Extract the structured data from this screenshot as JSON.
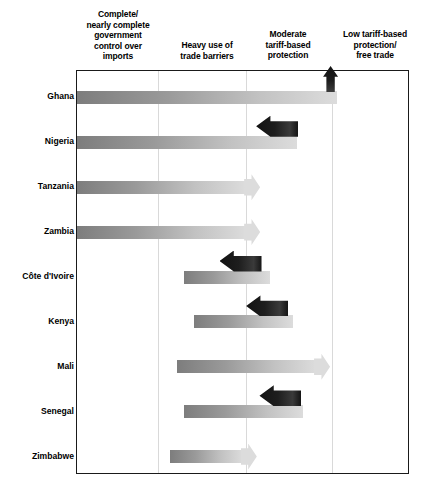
{
  "chart_data": {
    "type": "bar",
    "title": "",
    "subtitle": "",
    "xlabel": "",
    "ylabel": "",
    "grid": true,
    "legend_position": "none",
    "orientation": "horizontal",
    "axis_categories": [
      "Complete/\nnearly complete\ngovernment\ncontrol over\nimports",
      "Heavy use of\ntrade barriers",
      "Moderate\ntariff-based\nprotection",
      "Low tariff-based\nprotection/\nfree trade"
    ],
    "categories": [
      "Ghana",
      "Nigeria",
      "Tanzania",
      "Zambia",
      "Côte d'Ivoire",
      "Kenya",
      "Mali",
      "Senegal",
      "Zimbabwe"
    ],
    "bars": [
      {
        "country": "Ghana",
        "start_pct": 0,
        "end_pct": 78,
        "has_arrowhead": false,
        "reform_arrow": "up",
        "reform_arrow_pct": 76
      },
      {
        "country": "Nigeria",
        "start_pct": 0,
        "end_pct": 66,
        "has_arrowhead": false,
        "reform_arrow": "left",
        "reform_arrow_pct": 55
      },
      {
        "country": "Tanzania",
        "start_pct": 0,
        "end_pct": 55,
        "has_arrowhead": true,
        "reform_arrow": "none",
        "reform_arrow_pct": null
      },
      {
        "country": "Zambia",
        "start_pct": 0,
        "end_pct": 55,
        "has_arrowhead": true,
        "reform_arrow": "none",
        "reform_arrow_pct": null
      },
      {
        "country": "Côte d'Ivoire",
        "start_pct": 32,
        "end_pct": 58,
        "has_arrowhead": false,
        "reform_arrow": "left",
        "reform_arrow_pct": 44
      },
      {
        "country": "Kenya",
        "start_pct": 35,
        "end_pct": 65,
        "has_arrowhead": false,
        "reform_arrow": "left",
        "reform_arrow_pct": 52
      },
      {
        "country": "Mali",
        "start_pct": 30,
        "end_pct": 76,
        "has_arrowhead": true,
        "reform_arrow": "none",
        "reform_arrow_pct": null
      },
      {
        "country": "Senegal",
        "start_pct": 32,
        "end_pct": 68,
        "has_arrowhead": false,
        "reform_arrow": "left",
        "reform_arrow_pct": 56
      },
      {
        "country": "Zimbabwe",
        "start_pct": 28,
        "end_pct": 54,
        "has_arrowhead": true,
        "reform_arrow": "none",
        "reform_arrow_pct": null
      }
    ],
    "gridline_pcts": [
      24.3,
      50.7,
      76.6
    ]
  },
  "headers": {
    "col1_line1": "Complete/",
    "col1_line2": "nearly complete",
    "col1_line3": "government",
    "col1_line4": "control over",
    "col1_line5": "imports",
    "col2_line1": "Heavy use of",
    "col2_line2": "trade barriers",
    "col3_line1": "Moderate",
    "col3_line2": "tariff-based",
    "col3_line3": "protection",
    "col4_line1": "Low tariff-based",
    "col4_line2": "protection/",
    "col4_line3": "free trade"
  },
  "colors": {
    "bar_gradient_dark": "#7d7d7d",
    "bar_gradient_light": "#dcdcdc",
    "reform_arrow": "#161616",
    "frame": "#1a1a1a",
    "gridline": "#d9d9d9",
    "text": "#000000",
    "background": "#ffffff"
  }
}
